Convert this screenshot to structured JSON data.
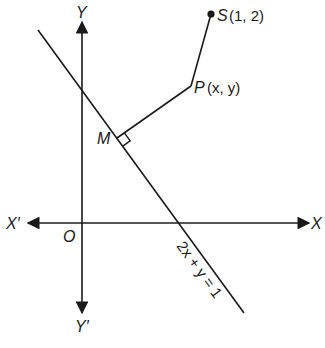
{
  "diagram": {
    "type": "coordinate-geometry",
    "colors": {
      "ink": "#1a1a1a",
      "background": "#ffffff"
    },
    "axes": {
      "x_positive_label": "X",
      "x_negative_label": "X′",
      "y_positive_label": "Y",
      "y_negative_label": "Y′",
      "origin_label": "O"
    },
    "line": {
      "equation": "2x + y = 1"
    },
    "points": {
      "S": {
        "name": "S",
        "coords": "(1, 2)"
      },
      "P": {
        "name": "P",
        "coords": "(x, y)"
      },
      "M": {
        "name": "M"
      }
    }
  }
}
